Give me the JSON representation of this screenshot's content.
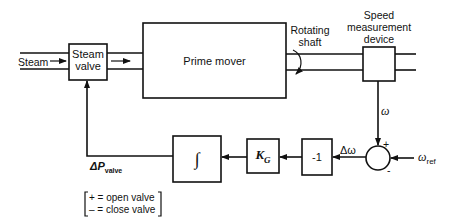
{
  "diagram": {
    "type": "block-diagram",
    "inputs": {
      "steam_label": "Steam",
      "omega_ref_symbol": "ω",
      "omega_ref_sub": "ref"
    },
    "blocks": {
      "steam_valve": {
        "line1": "Steam",
        "line2": "valve"
      },
      "prime_mover": {
        "label": "Prime mover"
      },
      "speed_device": {
        "line1": "Speed",
        "line2": "measurement",
        "line3": "device"
      },
      "gain_neg": {
        "label": "-1"
      },
      "gain_kg": {
        "symbol": "K",
        "sub": "G"
      },
      "integrator": {
        "label": "∫"
      }
    },
    "annotations": {
      "rotating_shaft_line1": "Rotating",
      "rotating_shaft_line2": "shaft",
      "omega": "ω",
      "delta_omega": "Δω",
      "plus_sign": "+",
      "minus_sign": "-",
      "delta_p_symbol": "ΔP",
      "delta_p_sub": "valve",
      "legend_line1": "+ = open valve",
      "legend_line2": "– = close valve"
    },
    "colors": {
      "line": "#111111",
      "background": "#ffffff"
    }
  }
}
